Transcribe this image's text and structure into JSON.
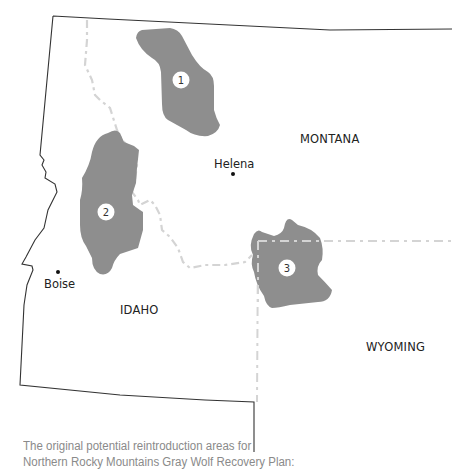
{
  "map": {
    "states": [
      {
        "name": "MONTANA"
      },
      {
        "name": "IDAHO"
      },
      {
        "name": "WYOMING"
      }
    ],
    "cities": [
      {
        "name": "Helena"
      },
      {
        "name": "Boise"
      }
    ],
    "areas": [
      {
        "number": "1"
      },
      {
        "number": "2"
      },
      {
        "number": "3"
      }
    ],
    "colors": {
      "area_fill": "#8e8e8e",
      "border": "#333333",
      "dashed_border": "#d4d4d4",
      "caption_text": "#8a8a8a"
    }
  },
  "caption": {
    "line1": "The original potential reintroduction areas for",
    "line2": "Northern Rocky Mountains Gray Wolf Recovery Plan:"
  }
}
